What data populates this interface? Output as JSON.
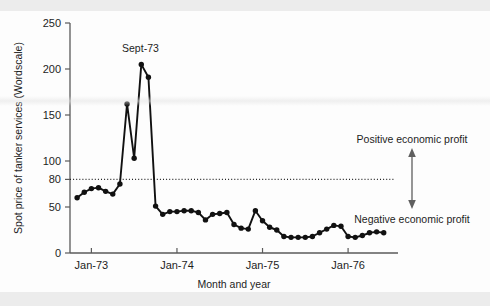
{
  "figure": {
    "name": "spot-price-tanker-services-chart",
    "background": "#fdfdfd",
    "ink_color": "#111111",
    "axis_color": "#5a5a5a",
    "annotation_color": "#5f5f5f"
  },
  "chart_data": {
    "type": "line",
    "title": "",
    "xlabel": "Month and year",
    "ylabel": "Spot price of tanker services (Wordscale)",
    "ylim": [
      0,
      250
    ],
    "yticks": [
      0,
      50,
      80,
      100,
      150,
      200,
      250
    ],
    "ytick_labels": [
      "0",
      "50",
      "80",
      "100",
      "150",
      "200",
      "250"
    ],
    "xtick_labels": [
      "Jan-73",
      "Jan-74",
      "Jan-75",
      "Jan-76"
    ],
    "xtick_months": [
      "1973-01",
      "1974-01",
      "1975-01",
      "1976-01"
    ],
    "xlim_months": [
      "1972-10",
      "1976-08"
    ],
    "grid": false,
    "legend": false,
    "reference_line": {
      "value": 80,
      "style": "dotted",
      "label_above": "Positive economic profit",
      "label_below": "Negative economic profit"
    },
    "annotations": [
      {
        "text": "Sept-73",
        "points_to_month": "1973-09",
        "points_to_value": 205
      },
      {
        "text": "Positive economic profit",
        "kind": "region-label",
        "position": "above-reference-line"
      },
      {
        "text": "Negative economic profit",
        "kind": "region-label",
        "position": "below-reference-line"
      }
    ],
    "series": [
      {
        "name": "Spot price of tanker services",
        "marker": "filled-circle",
        "x": [
          "1972-11",
          "1972-12",
          "1973-01",
          "1973-02",
          "1973-03",
          "1973-04",
          "1973-05",
          "1973-06",
          "1973-07",
          "1973-08",
          "1973-09",
          "1973-10",
          "1973-11",
          "1973-12",
          "1974-01",
          "1974-02",
          "1974-03",
          "1974-04",
          "1974-05",
          "1974-06",
          "1974-07",
          "1974-08",
          "1974-09",
          "1974-10",
          "1974-11",
          "1974-12",
          "1975-01",
          "1975-02",
          "1975-03",
          "1975-04",
          "1975-05",
          "1975-06",
          "1975-07",
          "1975-08",
          "1975-09",
          "1975-10",
          "1975-11",
          "1975-12",
          "1976-01",
          "1976-02",
          "1976-03",
          "1976-04",
          "1976-05",
          "1976-06"
        ],
        "values": [
          60,
          66,
          70,
          71,
          67,
          64,
          75,
          162,
          103,
          205,
          191,
          51,
          42,
          45,
          45,
          46,
          46,
          44,
          36,
          42,
          43,
          44,
          31,
          27,
          26,
          46,
          35,
          28,
          25,
          18,
          17,
          17,
          17,
          18,
          22,
          26,
          30,
          29,
          18,
          17,
          19,
          22,
          23,
          22
        ]
      }
    ]
  }
}
